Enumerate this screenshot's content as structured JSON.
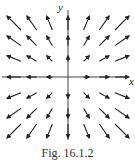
{
  "figure": {
    "type": "vector-field",
    "axes": {
      "x_label": "x",
      "y_label": "y"
    },
    "caption": "Fig. 16.1.2",
    "grid": {
      "x_values": [
        -3,
        -2,
        -1,
        0,
        1,
        2,
        3
      ],
      "y_values": [
        3,
        2,
        1,
        0,
        -1,
        -2,
        -3
      ]
    },
    "colors": {
      "ink": "#222222",
      "background": "#ffffff"
    }
  }
}
